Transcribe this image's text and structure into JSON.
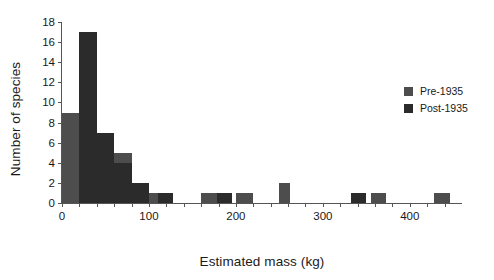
{
  "chart_data": {
    "type": "bar",
    "title": "",
    "subtitle": "",
    "xlabel": "Estimated mass (kg)",
    "ylabel": "Number of species",
    "xlim": [
      0,
      460
    ],
    "ylim": [
      0,
      18
    ],
    "grid": false,
    "bin_width": 20,
    "legend_position": "right",
    "xticks": [
      0,
      100,
      200,
      300,
      400
    ],
    "xtick_labels": [
      "0",
      "100",
      "200",
      "300",
      "400"
    ],
    "xticks_minor": [
      20,
      40,
      60,
      80,
      120,
      140,
      160,
      180,
      220,
      240,
      260,
      280,
      320,
      340,
      360,
      380,
      420,
      440
    ],
    "yticks": [
      0,
      2,
      4,
      6,
      8,
      10,
      12,
      14,
      16,
      18
    ],
    "ytick_labels": [
      "0",
      "2",
      "4",
      "6",
      "8",
      "10",
      "12",
      "14",
      "16",
      "18"
    ],
    "series": [
      {
        "name": "Pre-1935",
        "color": "#4d4d4d",
        "bins": [
          {
            "x0": 0,
            "x1": 20,
            "value": 9
          },
          {
            "x0": 40,
            "x1": 60,
            "value": 1
          },
          {
            "x0": 60,
            "x1": 80,
            "value": 5
          },
          {
            "x0": 100,
            "x1": 120,
            "value": 1
          },
          {
            "x0": 160,
            "x1": 180,
            "value": 1
          },
          {
            "x0": 200,
            "x1": 220,
            "value": 1
          },
          {
            "x0": 250,
            "x1": 262,
            "value": 2
          },
          {
            "x0": 355,
            "x1": 373,
            "value": 1
          },
          {
            "x0": 428,
            "x1": 446,
            "value": 1
          }
        ]
      },
      {
        "name": "Post-1935",
        "color": "#2b2b2b",
        "bins": [
          {
            "x0": 20,
            "x1": 40,
            "value": 17
          },
          {
            "x0": 40,
            "x1": 60,
            "value": 7
          },
          {
            "x0": 60,
            "x1": 80,
            "value": 4
          },
          {
            "x0": 80,
            "x1": 100,
            "value": 2
          },
          {
            "x0": 110,
            "x1": 128,
            "value": 1
          },
          {
            "x0": 178,
            "x1": 196,
            "value": 1
          },
          {
            "x0": 332,
            "x1": 350,
            "value": 1
          }
        ]
      }
    ]
  },
  "legend": {
    "entries": [
      {
        "label": "Pre-1935",
        "color": "#4d4d4d"
      },
      {
        "label": "Post-1935",
        "color": "#2b2b2b"
      }
    ]
  }
}
